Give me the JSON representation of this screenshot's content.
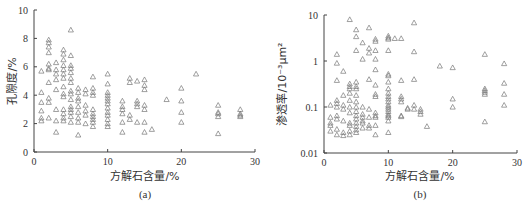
{
  "chart_data": [
    {
      "type": "scatter",
      "panel": "(a)",
      "title": "",
      "xlabel": "方解石含量/%",
      "ylabel": "孔隙度/%",
      "xlim": [
        0,
        30
      ],
      "ylim": [
        0,
        10
      ],
      "x_ticks": [
        "0",
        "10",
        "20",
        "30"
      ],
      "y_ticks": [
        "0",
        "2",
        "4",
        "6",
        "8",
        "10"
      ],
      "grid": false,
      "marker": "triangle-open",
      "points": [
        [
          1,
          5.7
        ],
        [
          1,
          4.2
        ],
        [
          1,
          3.5
        ],
        [
          1,
          2.9
        ],
        [
          1,
          2.4
        ],
        [
          1,
          2.2
        ],
        [
          2,
          7.9
        ],
        [
          2,
          7.7
        ],
        [
          2,
          7.4
        ],
        [
          2,
          7.0
        ],
        [
          2,
          6.2
        ],
        [
          2,
          5.9
        ],
        [
          2,
          5.8
        ],
        [
          2,
          4.9
        ],
        [
          2,
          3.8
        ],
        [
          2,
          3.5
        ],
        [
          2,
          2.4
        ],
        [
          3,
          6.3
        ],
        [
          3,
          5.8
        ],
        [
          3,
          5.5
        ],
        [
          3,
          5.1
        ],
        [
          3,
          4.4
        ],
        [
          3,
          3.0
        ],
        [
          3,
          2.2
        ],
        [
          3,
          1.4
        ],
        [
          4,
          7.2
        ],
        [
          4,
          6.9
        ],
        [
          4,
          6.5
        ],
        [
          4,
          6.1
        ],
        [
          4,
          5.8
        ],
        [
          4,
          5.5
        ],
        [
          4,
          5.2
        ],
        [
          4,
          4.6
        ],
        [
          4,
          4.1
        ],
        [
          4,
          3.9
        ],
        [
          4,
          3.0
        ],
        [
          4,
          2.7
        ],
        [
          4,
          2.4
        ],
        [
          4,
          2.2
        ],
        [
          5,
          8.6
        ],
        [
          5,
          6.8
        ],
        [
          5,
          6.1
        ],
        [
          5,
          5.9
        ],
        [
          5,
          5.6
        ],
        [
          5,
          5.2
        ],
        [
          5,
          4.9
        ],
        [
          5,
          4.3
        ],
        [
          5,
          4.1
        ],
        [
          5,
          3.7
        ],
        [
          5,
          3.2
        ],
        [
          5,
          3.0
        ],
        [
          5,
          2.8
        ],
        [
          5,
          2.5
        ],
        [
          5,
          2.1
        ],
        [
          6,
          4.5
        ],
        [
          6,
          4.2
        ],
        [
          6,
          3.8
        ],
        [
          6,
          3.6
        ],
        [
          6,
          3.2
        ],
        [
          6,
          2.8
        ],
        [
          6,
          2.4
        ],
        [
          6,
          2.1
        ],
        [
          6,
          1.2
        ],
        [
          7,
          4.4
        ],
        [
          7,
          4.1
        ],
        [
          7,
          3.3
        ],
        [
          7,
          2.9
        ],
        [
          7,
          2.6
        ],
        [
          7,
          2.0
        ],
        [
          8,
          5.3
        ],
        [
          8,
          4.5
        ],
        [
          8,
          4.2
        ],
        [
          8,
          4.0
        ],
        [
          8,
          3.0
        ],
        [
          8,
          2.7
        ],
        [
          8,
          2.5
        ],
        [
          8,
          2.3
        ],
        [
          8,
          2.1
        ],
        [
          8,
          1.8
        ],
        [
          10,
          5.5
        ],
        [
          10,
          4.8
        ],
        [
          10,
          4.2
        ],
        [
          10,
          4.0
        ],
        [
          10,
          3.8
        ],
        [
          10,
          3.6
        ],
        [
          10,
          3.4
        ],
        [
          10,
          3.1
        ],
        [
          10,
          2.8
        ],
        [
          10,
          2.6
        ],
        [
          10,
          2.3
        ],
        [
          10,
          2.0
        ],
        [
          10,
          1.8
        ],
        [
          12,
          3.6
        ],
        [
          12,
          3.2
        ],
        [
          12,
          3.0
        ],
        [
          12,
          2.7
        ],
        [
          12,
          2.1
        ],
        [
          12,
          1.4
        ],
        [
          13,
          5.2
        ],
        [
          13,
          4.9
        ],
        [
          13,
          2.6
        ],
        [
          13,
          2.3
        ],
        [
          14,
          5.0
        ],
        [
          14,
          3.6
        ],
        [
          14,
          3.4
        ],
        [
          14,
          3.2
        ],
        [
          14,
          2.1
        ],
        [
          15,
          5.1
        ],
        [
          15,
          4.7
        ],
        [
          15,
          4.4
        ],
        [
          15,
          3.3
        ],
        [
          15,
          3.0
        ],
        [
          15,
          2.1
        ],
        [
          15,
          1.4
        ],
        [
          16,
          1.6
        ],
        [
          18,
          3.7
        ],
        [
          20,
          4.5
        ],
        [
          20,
          3.6
        ],
        [
          20,
          2.8
        ],
        [
          20,
          2.1
        ],
        [
          22,
          5.5
        ],
        [
          25,
          3.3
        ],
        [
          25,
          2.8
        ],
        [
          25,
          2.7
        ],
        [
          25,
          2.5
        ],
        [
          25,
          1.3
        ],
        [
          28,
          3.0
        ],
        [
          28,
          2.7
        ],
        [
          28,
          2.6
        ],
        [
          28,
          2.5
        ]
      ]
    },
    {
      "type": "scatter",
      "panel": "(b)",
      "title": "",
      "xlabel": "方解石含量/%",
      "ylabel": "渗透率/10⁻³μm²",
      "xlim": [
        0,
        30
      ],
      "ylim": [
        0.01,
        10
      ],
      "yscale": "log",
      "x_ticks": [
        "0",
        "10",
        "20",
        "30"
      ],
      "y_ticks": [
        "0.01",
        "0.1",
        "1",
        "10"
      ],
      "grid": false,
      "marker": "triangle-open",
      "points": [
        [
          1,
          0.11
        ],
        [
          1,
          0.06
        ],
        [
          1,
          0.045
        ],
        [
          1,
          0.04
        ],
        [
          1,
          0.03
        ],
        [
          2,
          1.4
        ],
        [
          2,
          0.9
        ],
        [
          2,
          0.38
        ],
        [
          2,
          0.14
        ],
        [
          2,
          0.12
        ],
        [
          2,
          0.1
        ],
        [
          2,
          0.065
        ],
        [
          2,
          0.055
        ],
        [
          2,
          0.033
        ],
        [
          2,
          0.025
        ],
        [
          3,
          0.6
        ],
        [
          3,
          0.18
        ],
        [
          3,
          0.11
        ],
        [
          3,
          0.09
        ],
        [
          3,
          0.05
        ],
        [
          3,
          0.028
        ],
        [
          3,
          0.024
        ],
        [
          4,
          8.0
        ],
        [
          4,
          0.32
        ],
        [
          4,
          0.28
        ],
        [
          4,
          0.25
        ],
        [
          4,
          0.2
        ],
        [
          4,
          0.14
        ],
        [
          4,
          0.1
        ],
        [
          4,
          0.075
        ],
        [
          4,
          0.045
        ],
        [
          4,
          0.04
        ],
        [
          4,
          0.03
        ],
        [
          4,
          0.025
        ],
        [
          5,
          4.8
        ],
        [
          5,
          3.4
        ],
        [
          5,
          1.7
        ],
        [
          5,
          0.35
        ],
        [
          5,
          0.28
        ],
        [
          5,
          0.25
        ],
        [
          5,
          0.18
        ],
        [
          5,
          0.13
        ],
        [
          5,
          0.1
        ],
        [
          5,
          0.08
        ],
        [
          5,
          0.065
        ],
        [
          5,
          0.055
        ],
        [
          5,
          0.045
        ],
        [
          5,
          0.038
        ],
        [
          5,
          0.032
        ],
        [
          5,
          0.028
        ],
        [
          6,
          2.5
        ],
        [
          6,
          1.1
        ],
        [
          6,
          0.1
        ],
        [
          6,
          0.07
        ],
        [
          6,
          0.06
        ],
        [
          6,
          0.05
        ],
        [
          6,
          0.045
        ],
        [
          6,
          0.035
        ],
        [
          7,
          5.3
        ],
        [
          7,
          1.9
        ],
        [
          7,
          1.5
        ],
        [
          7,
          0.4
        ],
        [
          7,
          0.09
        ],
        [
          7,
          0.06
        ],
        [
          7,
          0.04
        ],
        [
          7,
          0.035
        ],
        [
          8,
          3.0
        ],
        [
          8,
          2.7
        ],
        [
          8,
          1.7
        ],
        [
          8,
          1.1
        ],
        [
          8,
          0.65
        ],
        [
          8,
          0.3
        ],
        [
          8,
          0.19
        ],
        [
          8,
          0.17
        ],
        [
          8,
          0.075
        ],
        [
          8,
          0.065
        ],
        [
          8,
          0.06
        ],
        [
          8,
          0.04
        ],
        [
          8,
          0.025
        ],
        [
          10,
          3.5
        ],
        [
          10,
          3.2
        ],
        [
          10,
          3.0
        ],
        [
          10,
          1.7
        ],
        [
          10,
          0.52
        ],
        [
          10,
          0.48
        ],
        [
          10,
          0.35
        ],
        [
          10,
          0.25
        ],
        [
          10,
          0.2
        ],
        [
          10,
          0.17
        ],
        [
          10,
          0.15
        ],
        [
          10,
          0.13
        ],
        [
          10,
          0.11
        ],
        [
          10,
          0.1
        ],
        [
          10,
          0.09
        ],
        [
          10,
          0.08
        ],
        [
          10,
          0.07
        ],
        [
          10,
          0.065
        ],
        [
          10,
          0.06
        ],
        [
          10,
          0.05
        ],
        [
          10,
          0.028
        ],
        [
          11,
          3.1
        ],
        [
          12,
          3.1
        ],
        [
          12,
          0.38
        ],
        [
          12,
          0.17
        ],
        [
          12,
          0.15
        ],
        [
          12,
          0.13
        ],
        [
          12,
          0.065
        ],
        [
          12,
          0.062
        ],
        [
          13,
          0.095
        ],
        [
          13,
          0.09
        ],
        [
          14,
          6.8
        ],
        [
          14,
          1.6
        ],
        [
          14,
          0.4
        ],
        [
          14,
          0.11
        ],
        [
          14,
          0.09
        ],
        [
          15,
          0.09
        ],
        [
          15,
          0.08
        ],
        [
          15,
          0.07
        ],
        [
          16,
          0.038
        ],
        [
          18,
          0.78
        ],
        [
          20,
          0.72
        ],
        [
          20,
          0.15
        ],
        [
          20,
          0.1
        ],
        [
          25,
          1.4
        ],
        [
          25,
          0.25
        ],
        [
          25,
          0.23
        ],
        [
          25,
          0.21
        ],
        [
          25,
          0.19
        ],
        [
          25,
          0.048
        ],
        [
          28,
          0.88
        ],
        [
          28,
          0.33
        ],
        [
          28,
          0.19
        ],
        [
          28,
          0.11
        ]
      ]
    }
  ]
}
